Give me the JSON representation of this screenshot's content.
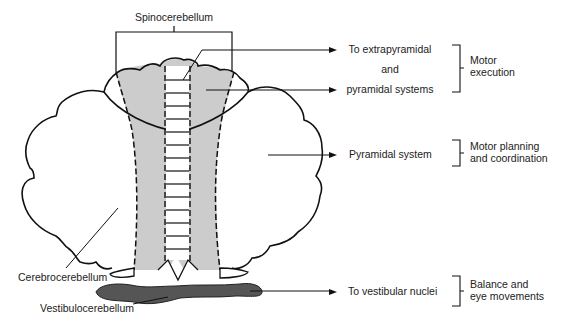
{
  "diagram": {
    "regions": {
      "spino": "Spinocerebellum",
      "cerebro": "Cerebrocerebellum",
      "vestibulo": "Vestibulocerebellum"
    },
    "outputs": {
      "extra_line1": "To extrapyramidal",
      "extra_line2": "and",
      "extra_line3": "pyramidal systems",
      "pyramidal": "Pyramidal system",
      "vestibular": "To vestibular nuclei"
    },
    "functions": {
      "motor_exec_1": "Motor",
      "motor_exec_2": "execution",
      "motor_plan_1": "Motor planning",
      "motor_plan_2": "and coordination",
      "balance_1": "Balance and",
      "balance_2": "eye movements"
    },
    "colors": {
      "spino_fill": "#cccccc",
      "vestibulo_fill": "#555555",
      "stroke": "#111111"
    }
  }
}
